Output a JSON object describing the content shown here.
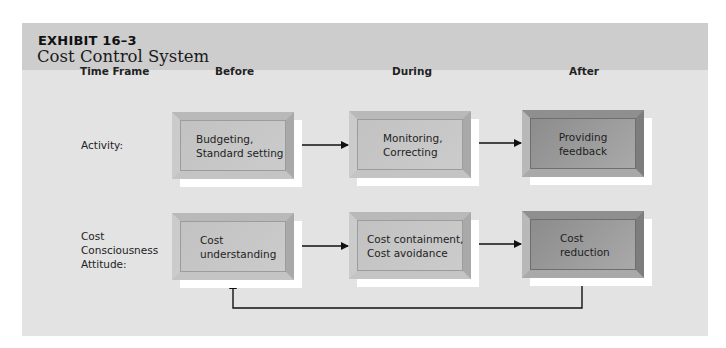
{
  "header": {
    "exhibit_label": "EXHIBIT 16–3",
    "title": "Cost Control System"
  },
  "columns": {
    "time_frame": "Time Frame",
    "before": "Before",
    "during": "During",
    "after": "After"
  },
  "rows": {
    "activity": {
      "label": "Activity:",
      "before": [
        "Budgeting,",
        "Standard setting"
      ],
      "during": [
        "Monitoring,",
        "Correcting"
      ],
      "after": [
        "Providing",
        "feedback"
      ]
    },
    "attitude": {
      "label": [
        "Cost",
        "Consciousness",
        "Attitude:"
      ],
      "before": [
        "Cost",
        "understanding"
      ],
      "during": [
        "Cost containment,",
        "Cost avoidance"
      ],
      "after": [
        "Cost",
        "reduction"
      ]
    }
  },
  "connectors": [
    {
      "from": "activity.before",
      "to": "activity.during",
      "type": "arrow"
    },
    {
      "from": "activity.during",
      "to": "activity.after",
      "type": "arrow"
    },
    {
      "from": "attitude.before",
      "to": "attitude.during",
      "type": "arrow"
    },
    {
      "from": "attitude.during",
      "to": "attitude.after",
      "type": "arrow"
    },
    {
      "from": "attitude.after",
      "to": "attitude.before",
      "type": "feedback-loop"
    }
  ],
  "colors": {
    "panel_bg": "#e3e3e3",
    "header_bg": "#cdcdcd",
    "box_light": "#c6c6c6",
    "box_dark": "#999999",
    "line": "#111111"
  }
}
